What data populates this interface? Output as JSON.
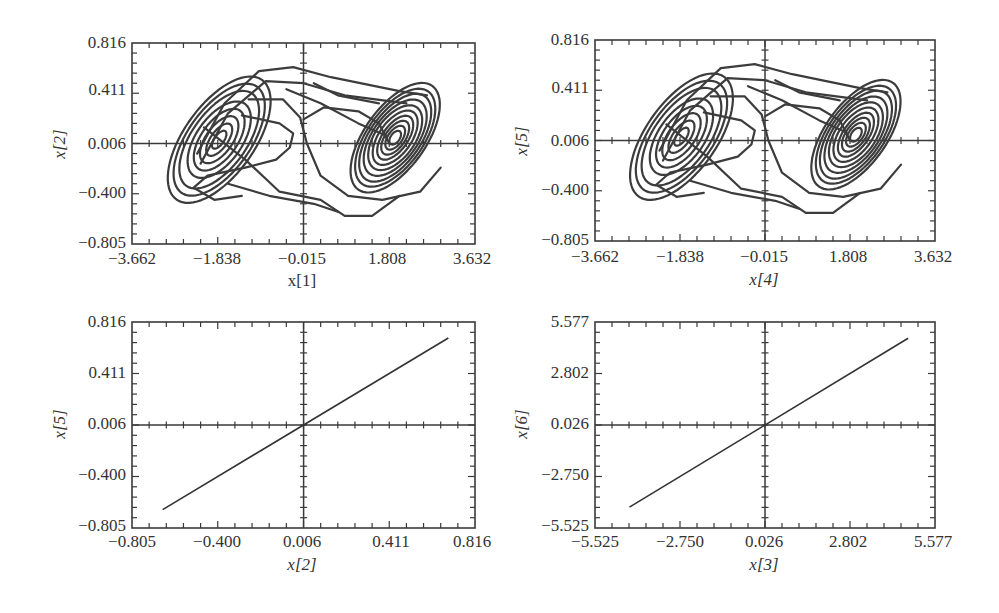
{
  "chart_data": [
    {
      "id": "top-left",
      "type": "line",
      "subtype": "phase-portrait",
      "title": "",
      "xlabel": "x[1]",
      "xlabel_italic": false,
      "ylabel": "x[2]",
      "xlim": [
        -3.662,
        3.632
      ],
      "ylim": [
        -0.805,
        0.816
      ],
      "xticks": [
        "-3.662",
        "-1.838",
        "-0.015",
        "1.808",
        "3.632"
      ],
      "yticks": [
        "0.816",
        "0.411",
        "0.006",
        "-0.400",
        "-0.805"
      ],
      "grid": false,
      "crosshair": {
        "x": -0.015,
        "y": 0.006
      },
      "description": "Double-scroll chaotic attractor with two spiral lobes centered near (-2.0, 0.0) and (2.0, 0.0)"
    },
    {
      "id": "top-right",
      "type": "line",
      "subtype": "phase-portrait",
      "title": "",
      "xlabel": "x[4]",
      "xlabel_italic": true,
      "ylabel": "x[5]",
      "xlim": [
        -3.662,
        3.632
      ],
      "ylim": [
        -0.805,
        0.816
      ],
      "xticks": [
        "-3.662",
        "-1.838",
        "-0.015",
        "1.808",
        "3.632"
      ],
      "yticks": [
        "0.816",
        "0.411",
        "0.006",
        "-0.400",
        "-0.805"
      ],
      "grid": false,
      "crosshair": {
        "x": -0.015,
        "y": 0.006
      },
      "description": "Double-scroll chaotic attractor identical in shape to x[1]-x[2] portrait (synchronized system)"
    },
    {
      "id": "bottom-left",
      "type": "line",
      "subtype": "synchronization-plot",
      "title": "",
      "xlabel": "x[2]",
      "xlabel_italic": true,
      "ylabel": "x[5]",
      "xlim": [
        -0.805,
        0.816
      ],
      "ylim": [
        -0.805,
        0.816
      ],
      "xticks": [
        "-0.805",
        "-0.400",
        "0.006",
        "0.411",
        "0.816"
      ],
      "yticks": [
        "0.816",
        "0.411",
        "0.006",
        "-0.400",
        "-0.805"
      ],
      "grid": false,
      "crosshair": {
        "x": 0.006,
        "y": 0.006
      },
      "series": [
        {
          "name": "x[5] vs x[2]",
          "x": [
            -0.66,
            0.69
          ],
          "y": [
            -0.66,
            0.69
          ]
        }
      ]
    },
    {
      "id": "bottom-right",
      "type": "line",
      "subtype": "synchronization-plot",
      "title": "",
      "xlabel": "x[3]",
      "xlabel_italic": true,
      "ylabel": "x[6]",
      "xlim": [
        -5.525,
        5.577
      ],
      "ylim": [
        -5.525,
        5.577
      ],
      "xticks": [
        "-5.525",
        "-2.750",
        "0.026",
        "2.802",
        "5.577"
      ],
      "yticks": [
        "5.577",
        "2.802",
        "0.026",
        "-2.750",
        "-5.525"
      ],
      "grid": false,
      "crosshair": {
        "x": 0.026,
        "y": 0.026
      },
      "series": [
        {
          "name": "x[6] vs x[3]",
          "x": [
            -4.4,
            4.7
          ],
          "y": [
            -4.4,
            4.7
          ]
        }
      ]
    }
  ],
  "panels": {
    "tl": {
      "xlabel": "x[1]",
      "ylabel": "x[2]",
      "xticks": [
        "−3.662",
        "−1.838",
        "−0.015",
        "1.808",
        "3.632"
      ],
      "yticks": [
        "0.816",
        "0.411",
        "0.006",
        "−0.400",
        "−0.805"
      ]
    },
    "tr": {
      "xlabel": "x[4]",
      "ylabel": "x[5]",
      "xticks": [
        "−3.662",
        "−1.838",
        "−0.015",
        "1.808",
        "3.632"
      ],
      "yticks": [
        "0.816",
        "0.411",
        "0.006",
        "−0.400",
        "−0.805"
      ]
    },
    "bl": {
      "xlabel": "x[2]",
      "ylabel": "x[5]",
      "xticks": [
        "−0.805",
        "−0.400",
        "0.006",
        "0.411",
        "0.816"
      ],
      "yticks": [
        "0.816",
        "0.411",
        "0.006",
        "−0.400",
        "−0.805"
      ]
    },
    "br": {
      "xlabel": "x[3]",
      "ylabel": "x[6]",
      "xticks": [
        "−5.525",
        "−2.750",
        "0.026",
        "2.802",
        "5.577"
      ],
      "yticks": [
        "5.577",
        "2.802",
        "0.026",
        "−2.750",
        "−5.525"
      ]
    }
  }
}
